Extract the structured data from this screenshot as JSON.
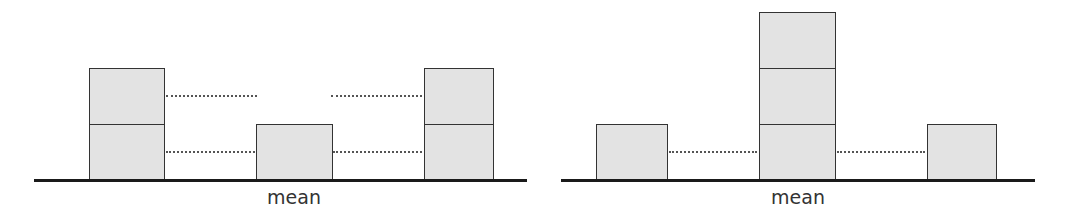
{
  "colors": {
    "box_fill": "#e3e3e3",
    "box_border": "#333333",
    "baseline": "#1a1a1a",
    "dotted": "#555555",
    "text": "#333333"
  },
  "diagrams": [
    {
      "name": "left-diagram",
      "label": "mean",
      "label_x": 294,
      "baseline": {
        "x1": 34,
        "x2": 527,
        "y": 179
      },
      "columns": [
        {
          "x": 89,
          "w": 76,
          "stack": 2
        },
        {
          "x": 256,
          "w": 77,
          "stack": 1
        },
        {
          "x": 424,
          "w": 70,
          "stack": 2
        }
      ],
      "dotted_lines": [
        {
          "x1": 166,
          "x2": 257,
          "y": 95
        },
        {
          "x1": 331,
          "x2": 422,
          "y": 95
        },
        {
          "x1": 166,
          "x2": 255,
          "y": 151
        },
        {
          "x1": 333,
          "x2": 422,
          "y": 151
        }
      ]
    },
    {
      "name": "right-diagram",
      "label": "mean",
      "label_x": 798,
      "baseline": {
        "x1": 561,
        "x2": 1035,
        "y": 179
      },
      "columns": [
        {
          "x": 596,
          "w": 72,
          "stack": 1
        },
        {
          "x": 759,
          "w": 77,
          "stack": 3
        },
        {
          "x": 927,
          "w": 70,
          "stack": 1
        }
      ],
      "dotted_lines": [
        {
          "x1": 669,
          "x2": 757,
          "y": 151
        },
        {
          "x1": 837,
          "x2": 925,
          "y": 151
        }
      ]
    }
  ],
  "unit_height": 56,
  "baseline_y": 180
}
